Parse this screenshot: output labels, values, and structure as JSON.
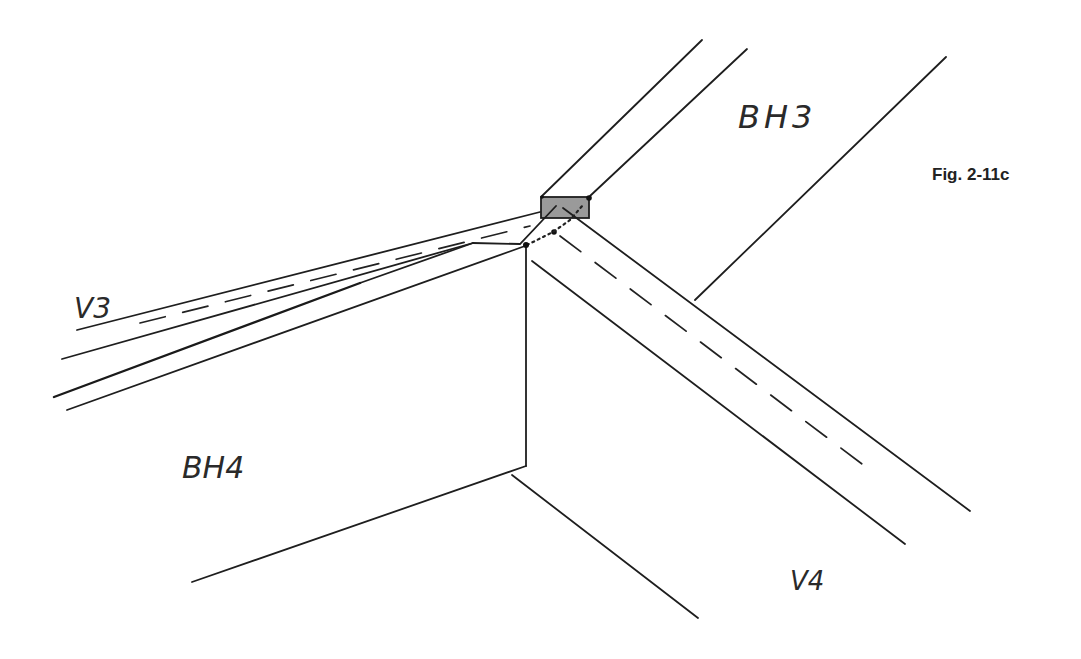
{
  "figure": {
    "caption": "Fig. 2-11c"
  },
  "labels": {
    "bh3": "BH3",
    "bh4": "BH4",
    "v3": "V3",
    "v4": "V4"
  },
  "colors": {
    "ink": "#1e1e1e",
    "post_fill": "#9a9a9a",
    "background": "#ffffff"
  }
}
